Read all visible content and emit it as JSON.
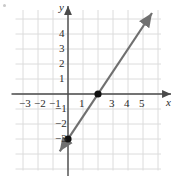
{
  "figure": {
    "width": 177,
    "height": 179,
    "background": "#ffffff",
    "corner_mark": "dot-mark"
  },
  "axes": {
    "x_label": "x",
    "y_label": "y",
    "axis_color": "#4a4a4a",
    "grid_color": "#dcdcdc",
    "origin_px": {
      "x": 68,
      "y": 94
    },
    "unit_px": 15,
    "grid_extent": {
      "x_min": -3.5,
      "x_max": 6.2,
      "y_min": -5.1,
      "y_max": 5.6
    },
    "x_ticks": [
      {
        "value": -3,
        "label": "−3"
      },
      {
        "value": -2,
        "label": "−2"
      },
      {
        "value": -1,
        "label": "−1"
      },
      {
        "value": 1,
        "label": "1"
      },
      {
        "value": 3,
        "label": "3"
      },
      {
        "value": 4,
        "label": "4"
      },
      {
        "value": 5,
        "label": "5"
      }
    ],
    "y_ticks": [
      {
        "value": 4,
        "label": "4"
      },
      {
        "value": 3,
        "label": "3"
      },
      {
        "value": 2,
        "label": "2"
      },
      {
        "value": 1,
        "label": "1"
      },
      {
        "value": -1,
        "label": "−1"
      },
      {
        "value": -2,
        "label": "−2"
      },
      {
        "value": -3,
        "label": "−3"
      }
    ]
  },
  "chart_data": {
    "type": "line",
    "title": "",
    "xlabel": "x",
    "ylabel": "y",
    "xlim": [
      -3.5,
      6.2
    ],
    "ylim": [
      -5.1,
      5.6
    ],
    "grid": true,
    "legend": "none",
    "series": [
      {
        "name": "line",
        "equation": "y = 1.5x - 3",
        "slope": 1.5,
        "intercept": -3,
        "color": "#707070",
        "arrows": "both",
        "endpoints": [
          {
            "x": -0.55,
            "y": -3.82
          },
          {
            "x": 5.6,
            "y": 5.4
          }
        ],
        "points": [
          {
            "x": 0,
            "y": -3,
            "style": "filled-circle",
            "color": "#111111"
          },
          {
            "x": 2,
            "y": 0,
            "style": "filled-circle",
            "color": "#111111"
          }
        ]
      }
    ]
  }
}
